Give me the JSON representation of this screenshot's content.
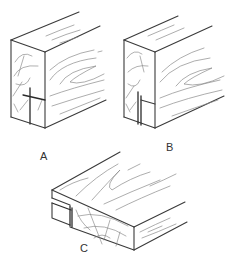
{
  "figure": {
    "panels": [
      {
        "id": "A",
        "label": "A",
        "caption": "Block with crossing cut lines on end grain"
      },
      {
        "id": "B",
        "label": "B",
        "caption": "Block with narrow kerf cut on end grain"
      },
      {
        "id": "C",
        "label": "C",
        "caption": "Block with rabbet cut along edge"
      }
    ]
  },
  "colors": {
    "line": "#3a3a3a",
    "grain": "#8a8a8a",
    "background": "#ffffff"
  }
}
